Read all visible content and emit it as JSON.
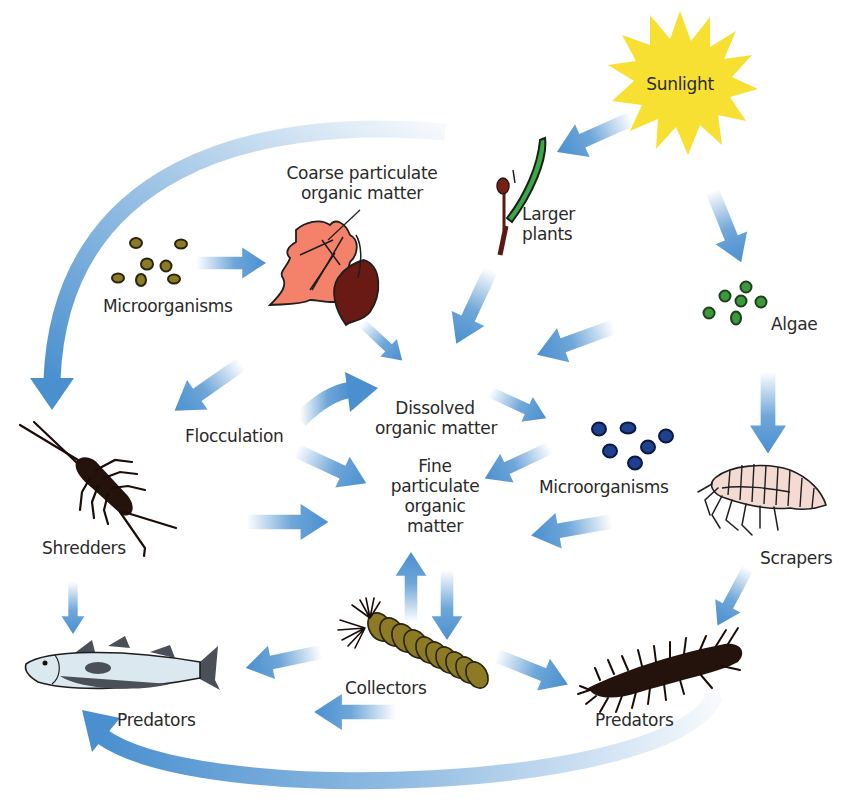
{
  "colors": {
    "arrow": "#4a90cf",
    "sun": "#f7e031",
    "leaf_orange": "#f4826a",
    "leaf_brown": "#6a1a14",
    "plant_green": "#3aa844",
    "algae": "#3a9a3a",
    "microbe_olive": "#8c7a24",
    "microbe_blue": "#1f3f8f",
    "collector": "#8c7a24",
    "fish": "#dce8f0",
    "insect_dark": "#24120c"
  },
  "nodes": {
    "sunlight": {
      "label": "Sunlight",
      "icon": "sun-icon"
    },
    "larger_plants": {
      "line1": "Larger",
      "line2": "plants",
      "icon": "plant-icon"
    },
    "algae": {
      "label": "Algae",
      "icon": "algae-icon"
    },
    "cpom": {
      "line1": "Coarse particulate",
      "line2": "organic matter",
      "icon": "leaves-icon"
    },
    "microorganisms_top": {
      "label": "Microorganisms",
      "icon": "microbe-cluster-icon"
    },
    "flocculation": {
      "label": "Flocculation"
    },
    "dom": {
      "line1": "Dissolved",
      "line2": "organic matter"
    },
    "fpom": {
      "line1": "Fine",
      "line2": "particulate",
      "line3": "organic",
      "line4": "matter"
    },
    "microorganisms_mid": {
      "label": "Microorganisms",
      "icon": "microbe-cluster-icon"
    },
    "shredders": {
      "label": "Shredders",
      "icon": "shredder-insect-icon"
    },
    "scrapers": {
      "label": "Scrapers",
      "icon": "scraper-crustacean-icon"
    },
    "collectors": {
      "label": "Collectors",
      "icon": "collector-larva-icon"
    },
    "predators_fish": {
      "label": "Predators",
      "icon": "fish-icon"
    },
    "predators_insect": {
      "label": "Predators",
      "icon": "predator-insect-icon"
    }
  },
  "edges": [
    {
      "from": "Sunlight",
      "to": "Larger plants"
    },
    {
      "from": "Sunlight",
      "to": "Algae"
    },
    {
      "from": "Microorganisms",
      "to": "Coarse particulate organic matter"
    },
    {
      "from": "Coarse particulate organic matter",
      "to": "Shredders"
    },
    {
      "from": "Coarse particulate organic matter",
      "to": "Dissolved organic matter"
    },
    {
      "from": "Larger plants",
      "to": "Dissolved organic matter"
    },
    {
      "from": "Algae",
      "to": "Dissolved organic matter"
    },
    {
      "from": "Larger plants",
      "to": "Shredders"
    },
    {
      "from": "Flocculation",
      "to": "Dissolved organic matter"
    },
    {
      "from": "Flocculation",
      "to": "Fine particulate organic matter"
    },
    {
      "from": "Dissolved organic matter",
      "to": "Microorganisms"
    },
    {
      "from": "Microorganisms",
      "to": "Fine particulate organic matter"
    },
    {
      "from": "Shredders",
      "to": "Fine particulate organic matter"
    },
    {
      "from": "Scrapers",
      "to": "Fine particulate organic matter"
    },
    {
      "from": "Algae",
      "to": "Scrapers"
    },
    {
      "from": "Fine particulate organic matter",
      "to": "Collectors"
    },
    {
      "from": "Collectors",
      "to": "Fine particulate organic matter"
    },
    {
      "from": "Shredders",
      "to": "Predators (fish)"
    },
    {
      "from": "Collectors",
      "to": "Predators (fish)"
    },
    {
      "from": "Collectors",
      "to": "Predators (insect)"
    },
    {
      "from": "Scrapers",
      "to": "Predators (insect)"
    },
    {
      "from": "Predators (insect)",
      "to": "Predators (fish)"
    }
  ]
}
